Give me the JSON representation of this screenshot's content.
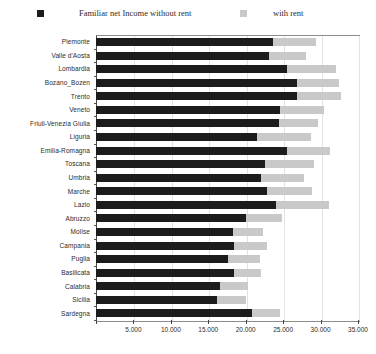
{
  "legend": {
    "series_dark_label": "Familiar net Income without rent",
    "series_light_label": "with rent",
    "dark_swatch_name": "dark-square-marker",
    "light_swatch_name": "light-square-marker"
  },
  "footer": {
    "note": "",
    "corner": ""
  },
  "colors": {
    "dark": "#1c1c1c",
    "light": "#c9c9c9",
    "grid": "#e2e2e2",
    "frame": "#8c8c8c",
    "text": "#2b2b2b"
  },
  "axis": {
    "x_min": 0,
    "x_max": 35000,
    "x_step": 5000,
    "x_tick_labels": [
      "",
      "5.000",
      "10.000",
      "15.000",
      "20.000",
      "25.000",
      "30.000",
      "35.000"
    ],
    "x_tick_values": [
      0,
      5000,
      10000,
      15000,
      20000,
      25000,
      30000,
      35000
    ]
  },
  "chart_data": {
    "type": "bar",
    "orientation": "horizontal",
    "stacked": true,
    "title": "",
    "subtitle": "",
    "xlabel": "",
    "ylabel": "",
    "xlim": [
      0,
      35000
    ],
    "grid": true,
    "legend_position": "top",
    "categories": [
      "Piemonte",
      "Valle d'Aosta",
      "Lombardia",
      "Bozano_Bozen",
      "Trento",
      "Veneto",
      "Friuli-Venezia Giulia",
      "Liguria",
      "Emilia-Romagna",
      "Toscana",
      "Umbria",
      "Marche",
      "Lazio",
      "Abruzzo",
      "Molise",
      "Campania",
      "Puglia",
      "Basilicata",
      "Calabria",
      "Sicilia",
      "Sardegna"
    ],
    "series": [
      {
        "name": "Familiar net Income without rent",
        "color": "#1c1c1c",
        "values": [
          23700,
          23100,
          25500,
          26800,
          26900,
          24600,
          24400,
          21500,
          25500,
          22600,
          22000,
          22800,
          24100,
          20000,
          18300,
          18500,
          17600,
          18400,
          16500,
          16200,
          20800
        ]
      },
      {
        "name": "with rent",
        "color": "#c9c9c9",
        "values": [
          29400,
          28000,
          32100,
          32400,
          32700,
          30500,
          29600,
          28700,
          31200,
          29100,
          27800,
          28800,
          31100,
          24800,
          22300,
          22800,
          21900,
          22000,
          20300,
          20000,
          24600
        ]
      }
    ],
    "value_unit": "euro"
  }
}
